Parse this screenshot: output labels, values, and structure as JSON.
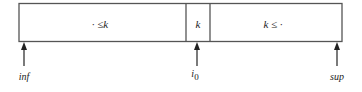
{
  "diagram": {
    "segments": [
      {
        "label": "· ≤k"
      },
      {
        "label": "k"
      },
      {
        "label": "k ≤ ·"
      }
    ],
    "pointers": [
      {
        "label": "inf"
      },
      {
        "label": "i",
        "sub": "0"
      },
      {
        "label": "sup"
      }
    ],
    "colors": {
      "stroke": "#555555",
      "text": "#222222",
      "background": "#ffffff"
    }
  }
}
